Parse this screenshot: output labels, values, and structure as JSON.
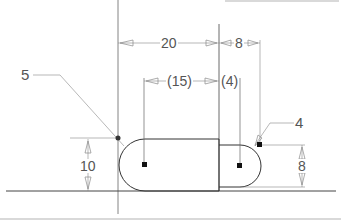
{
  "drawing": {
    "type": "cad-sketch",
    "dimensions": {
      "top_width": "20",
      "top_right_width": "8",
      "ref_width": "(15)",
      "ref_small": "(4)",
      "left_height": "10",
      "right_height": "8"
    },
    "callouts": {
      "left_radius": "5",
      "right_radius": "4"
    },
    "colors": {
      "geometry": "#333333",
      "dimension": "#888888",
      "background": "#ffffff"
    }
  }
}
